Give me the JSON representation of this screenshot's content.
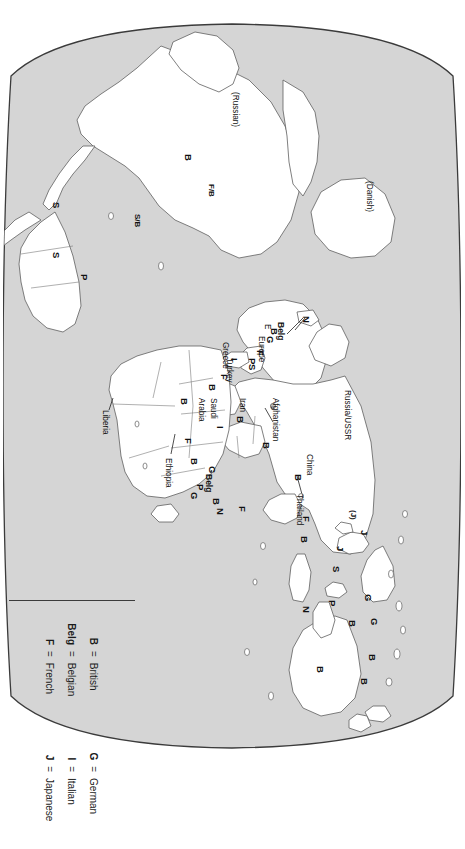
{
  "figure": {
    "kind": "world-map",
    "projection": "oval (Robinson-like) world projection",
    "orientation_note": "rotated 90 degrees in the source image",
    "colors": {
      "ocean": "#d5d5d5",
      "land": "#ffffff",
      "coastline": "#5a5a5a",
      "border": "#6b6b6b",
      "frame": "#3b3b3b",
      "label": "#111111"
    }
  },
  "legend": {
    "columns": [
      {
        "entries": [
          {
            "abbr": "B",
            "eq": "=",
            "name": "British"
          },
          {
            "abbr": "Belg",
            "eq": "=",
            "name": "Belgian"
          },
          {
            "abbr": "F",
            "eq": "=",
            "name": "French"
          }
        ]
      },
      {
        "entries": [
          {
            "abbr": "G",
            "eq": "=",
            "name": "German"
          },
          {
            "abbr": "I",
            "eq": "=",
            "name": "Italian"
          },
          {
            "abbr": "J",
            "eq": "=",
            "name": "Japanese"
          }
        ]
      },
      {
        "entries": [
          {
            "abbr": "N",
            "eq": "=",
            "name": "Netherlands"
          },
          {
            "abbr": "P",
            "eq": "=",
            "name": "Portuguese"
          },
          {
            "abbr": "S",
            "eq": "=",
            "name": "Spanish"
          }
        ]
      }
    ]
  },
  "map_labels": {
    "place_names": [
      {
        "text": "(Russian)",
        "x": 86,
        "y": 222
      },
      {
        "text": "(Danish)",
        "x": 175,
        "y": 88
      },
      {
        "text": "Russia/USSR",
        "x": 384,
        "y": 110
      },
      {
        "text": "Afghanistan",
        "x": 392,
        "y": 182
      },
      {
        "text": "China",
        "x": 448,
        "y": 148
      },
      {
        "text": "Thailand",
        "x": 488,
        "y": 158
      },
      {
        "text": "Iran",
        "x": 392,
        "y": 215
      },
      {
        "text": "Saudi",
        "x": 392,
        "y": 244
      },
      {
        "text": "Arabia",
        "x": 392,
        "y": 256
      },
      {
        "text": "Turkey",
        "x": 352,
        "y": 228
      },
      {
        "text": "Greece",
        "x": 336,
        "y": 232
      },
      {
        "text": "Europe",
        "x": 330,
        "y": 196
      },
      {
        "text": "E",
        "x": 318,
        "y": 190
      },
      {
        "text": "Ethiopia",
        "x": 452,
        "y": 289
      },
      {
        "text": "Liberia",
        "x": 404,
        "y": 352
      }
    ],
    "power_codes": [
      {
        "code": "B",
        "x": 148,
        "y": 268
      },
      {
        "code": "F/B",
        "x": 178,
        "y": 246
      },
      {
        "code": "S/B",
        "x": 208,
        "y": 320
      },
      {
        "code": "S",
        "x": 196,
        "y": 400
      },
      {
        "code": "S",
        "x": 246,
        "y": 400
      },
      {
        "code": "P",
        "x": 268,
        "y": 372
      },
      {
        "code": "N",
        "x": 310,
        "y": 150
      },
      {
        "code": "Belg",
        "x": 316,
        "y": 176
      },
      {
        "code": "B",
        "x": 322,
        "y": 182
      },
      {
        "code": "G",
        "x": 330,
        "y": 186
      },
      {
        "code": "F",
        "x": 344,
        "y": 196
      },
      {
        "code": "P",
        "x": 352,
        "y": 204
      },
      {
        "code": "S",
        "x": 358,
        "y": 204
      },
      {
        "code": "I",
        "x": 352,
        "y": 222
      },
      {
        "code": "F",
        "x": 368,
        "y": 232
      },
      {
        "code": "B",
        "x": 378,
        "y": 244
      },
      {
        "code": "B",
        "x": 392,
        "y": 272
      },
      {
        "code": "B",
        "x": 410,
        "y": 216
      },
      {
        "code": "I",
        "x": 420,
        "y": 236
      },
      {
        "code": "F",
        "x": 432,
        "y": 268
      },
      {
        "code": "B",
        "x": 452,
        "y": 262
      },
      {
        "code": "G",
        "x": 460,
        "y": 244
      },
      {
        "code": "Belg",
        "x": 468,
        "y": 248
      },
      {
        "code": "P",
        "x": 478,
        "y": 256
      },
      {
        "code": "G",
        "x": 486,
        "y": 262
      },
      {
        "code": "B",
        "x": 492,
        "y": 240
      },
      {
        "code": "N",
        "x": 502,
        "y": 236
      },
      {
        "code": "F",
        "x": 500,
        "y": 214
      },
      {
        "code": "B",
        "x": 436,
        "y": 190
      },
      {
        "code": "B",
        "x": 468,
        "y": 158
      },
      {
        "code": "F",
        "x": 510,
        "y": 150
      },
      {
        "code": "B",
        "x": 530,
        "y": 152
      },
      {
        "code": "(J)",
        "x": 504,
        "y": 104
      },
      {
        "code": "J",
        "x": 524,
        "y": 92
      },
      {
        "code": "J",
        "x": 540,
        "y": 116
      },
      {
        "code": "S",
        "x": 560,
        "y": 120
      },
      {
        "code": "G",
        "x": 588,
        "y": 88
      },
      {
        "code": "G",
        "x": 612,
        "y": 82
      },
      {
        "code": "B",
        "x": 614,
        "y": 104
      },
      {
        "code": "B",
        "x": 648,
        "y": 84
      },
      {
        "code": "B",
        "x": 672,
        "y": 92
      },
      {
        "code": "P",
        "x": 594,
        "y": 124
      },
      {
        "code": "N",
        "x": 600,
        "y": 150
      },
      {
        "code": "B",
        "x": 660,
        "y": 136
      }
    ]
  }
}
